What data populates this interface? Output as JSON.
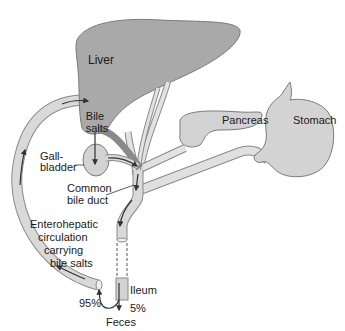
{
  "diagram": {
    "organs": {
      "liver": "Liver",
      "pancreas": "Pancreas",
      "stomach": "Stomach",
      "ileum": "Ileum"
    },
    "labels": {
      "bile_salts_line1": "Bile",
      "bile_salts_line2": "salts",
      "gallbladder_line1": "Gall-",
      "gallbladder_line2": "bladder",
      "common_bile_duct_line1": "Common",
      "common_bile_duct_line2": "bile duct",
      "circulation_line1": "Enterohepatic",
      "circulation_line2": "circulation",
      "circulation_line3": "carrying",
      "circulation_line4": "bile salts",
      "feces": "Feces"
    },
    "percentages": {
      "reabsorbed": "95%",
      "excreted": "5%"
    },
    "colors": {
      "organ_fill": "#a9a9a9",
      "duct_fill": "#d6d6d6",
      "outline": "#7a7a7a",
      "arrow": "#333333"
    }
  }
}
